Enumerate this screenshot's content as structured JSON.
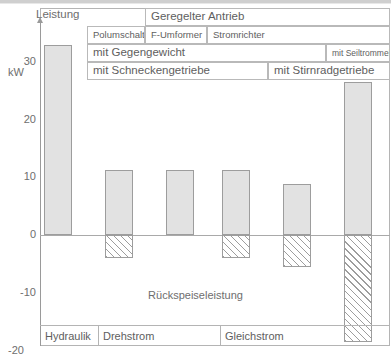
{
  "chart_data": {
    "type": "bar",
    "title": "",
    "ylabel": "Leistung",
    "yunit": "kW",
    "xlabel": "",
    "ylim": [
      -20,
      35
    ],
    "yticks": [
      30,
      20,
      10,
      0,
      -10,
      -20
    ],
    "ytick_labels": [
      "30",
      "20",
      "10",
      "0",
      "-10",
      "-20"
    ],
    "grid": false,
    "legend": "none",
    "annotation": "Rückspeiseleistung",
    "categories": [
      "Hydraulik",
      "Drehstrom",
      "Drehstrom",
      "Drehstrom",
      "Gleichstrom",
      "Gleichstrom"
    ],
    "series": [
      {
        "name": "Leistung",
        "values": [
          33.0,
          11.3,
          11.3,
          11.3,
          8.8,
          26.5
        ]
      },
      {
        "name": "Rückspeiseleistung",
        "values": [
          0,
          -4.0,
          0,
          -4.0,
          -5.5,
          -18.5
        ]
      }
    ]
  },
  "axis": {
    "title": "Leistung",
    "unit": "kW",
    "ticks": [
      {
        "label": "30",
        "value": 30
      },
      {
        "label": "20",
        "value": 20
      },
      {
        "label": "10",
        "value": 10
      },
      {
        "label": "0",
        "value": 0
      },
      {
        "label": "-10",
        "value": -10
      },
      {
        "label": "-20",
        "value": -20
      }
    ]
  },
  "header_table": {
    "row1": [
      {
        "label": "Geregelter Antrieb",
        "left": 58,
        "width": 245
      }
    ],
    "row2": [
      {
        "label": "Polumschalter",
        "left": 0,
        "width": 58
      },
      {
        "label": "F-Umformer",
        "left": 58,
        "width": 62
      },
      {
        "label": "Stromrichter",
        "left": 120,
        "width": 183
      }
    ],
    "row3": [
      {
        "label": "mit Gegengewicht",
        "left": 0,
        "width": 239
      },
      {
        "label": "mit Seiltrommel",
        "left": 239,
        "width": 64
      }
    ],
    "row4": [
      {
        "label": "mit Schneckengetriebe",
        "left": 0,
        "width": 181
      },
      {
        "label": "mit Stirnradgetriebe",
        "left": 181,
        "width": 122
      }
    ]
  },
  "annotation": {
    "recovery_label": "Rückspeiseleistung"
  },
  "categories": [
    {
      "label": "Hydraulik",
      "left": 0,
      "width": 58
    },
    {
      "label": "Drehstrom",
      "left": 58,
      "width": 122
    },
    {
      "label": "Gleichstrom",
      "left": 180,
      "width": 170
    }
  ],
  "bars": [
    {
      "name": "hydraulik",
      "x": 44,
      "width": 28,
      "pos": 33.0,
      "neg": 0
    },
    {
      "name": "drehstrom-polumschalter",
      "x": 105,
      "width": 28,
      "pos": 11.3,
      "neg": -4.0
    },
    {
      "name": "drehstrom-f-umformer",
      "x": 166,
      "width": 28,
      "pos": 11.3,
      "neg": 0
    },
    {
      "name": "drehstrom-stromrichter",
      "x": 222,
      "width": 28,
      "pos": 11.3,
      "neg": -4.0
    },
    {
      "name": "gleichstrom-seiltrommel",
      "x": 283,
      "width": 28,
      "pos": 8.8,
      "neg": -5.5
    },
    {
      "name": "gleichstrom-stirnrad",
      "x": 344,
      "width": 28,
      "pos": 26.5,
      "neg": -18.5
    }
  ],
  "colors": {
    "bar_fill": "#e2e2e2",
    "bar_stroke": "#9d9d9d",
    "frame": "#b4b4b4",
    "text": "#5e5e5e"
  }
}
